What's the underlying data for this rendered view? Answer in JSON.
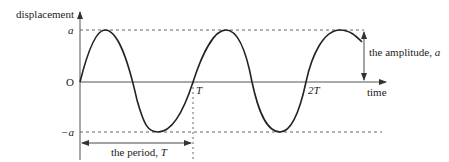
{
  "diagram": {
    "axes": {
      "y_label": "displacement",
      "x_label": "time",
      "origin_label": "O"
    },
    "y_ticks": {
      "top": "a",
      "bottom": "−a"
    },
    "x_ticks": {
      "t1": "T",
      "t2": "2T"
    },
    "annotations": {
      "amplitude_prefix": "the amplitude, ",
      "amplitude_symbol": "a",
      "period_prefix": "the period, ",
      "period_symbol": "T"
    },
    "colors": {
      "line": "#222222",
      "axis": "#555555",
      "dash": "#555555",
      "background": "#ffffff"
    }
  }
}
